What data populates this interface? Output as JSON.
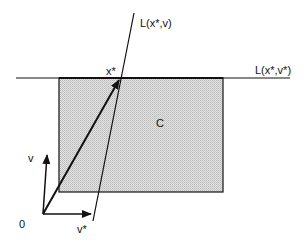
{
  "diagram": {
    "labels": {
      "line_v": "L(x*,v)",
      "line_vstar": "L(x*,v*)",
      "point_xstar": "x*",
      "set_c": "C",
      "vec_v": "v",
      "vec_vstar": "v*",
      "origin": "0"
    },
    "colors": {
      "stroke": "#111111",
      "fill_c": "#d4d4d4",
      "background": "#ffffff"
    }
  }
}
